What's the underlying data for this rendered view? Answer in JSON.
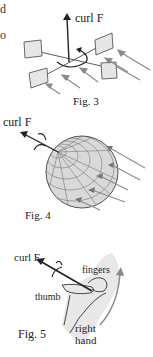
{
  "page": {
    "partial_text": [
      "d",
      "o"
    ]
  },
  "figures": [
    {
      "id": "fig3",
      "caption": "Fig. 3",
      "vector_label": "curl F",
      "description": "small square paddles around an axis with flow arrows; curl F vector pointing up with rotation arrow"
    },
    {
      "id": "fig4",
      "caption": "Fig. 4",
      "vector_label": "curl F",
      "description": "meshed sphere with flow lines and curl F vector out of the sphere with rotation arrow"
    },
    {
      "id": "fig5",
      "caption": "Fig. 5",
      "vector_label": "curl F",
      "labels": {
        "fingers": "fingers",
        "thumb": "thumb",
        "hand_line1": "right",
        "hand_line2": "hand"
      },
      "description": "right-hand rule: thumb points along curl F, fingers curl in rotation direction"
    }
  ],
  "colors": {
    "ink": "#222222",
    "paddle_fill": "#e6e6e6",
    "arrow_gray": "#8a8a8a",
    "sphere_fill": "#d9d9d9",
    "hand_fill": "#e8e8e8"
  }
}
